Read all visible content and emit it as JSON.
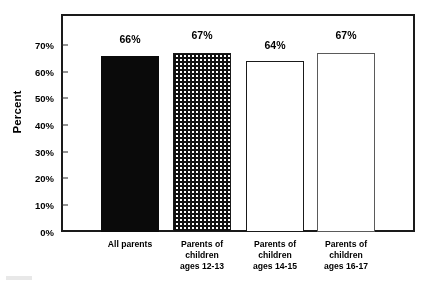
{
  "chart_data": {
    "type": "bar",
    "title": "",
    "xlabel": "",
    "ylabel": "Percent",
    "ylim": [
      0,
      70
    ],
    "grid": false,
    "legend": "none",
    "categories": [
      "All parents",
      "Parents of children ages 12-13",
      "Parents of children ages 14-15",
      "Parents of children ages 16-17"
    ],
    "category_lines": [
      [
        "All parents"
      ],
      [
        "Parents of",
        "children",
        "ages 12-13"
      ],
      [
        "Parents of",
        "children",
        "ages 14-15"
      ],
      [
        "Parents of",
        "children",
        "ages 16-17"
      ]
    ],
    "values": [
      66,
      67,
      64,
      67
    ],
    "value_labels": [
      "66%",
      "67%",
      "64%",
      "67%"
    ],
    "bar_fills": [
      "solid-black",
      "dense-checkerboard",
      "sparse-dots",
      "open-white"
    ],
    "ytick_labels": [
      "70%",
      "60%",
      "50%",
      "40%",
      "30%",
      "20%",
      "10%",
      "0%"
    ],
    "ytick_values": [
      70,
      60,
      50,
      40,
      30,
      20,
      10,
      0
    ]
  },
  "colors": {
    "axis": "#1a1a1a",
    "bar_solid": "#0a0a0a",
    "pattern": "#111111",
    "background": "#ffffff",
    "open_bar_outline": "#5a5a5a"
  }
}
